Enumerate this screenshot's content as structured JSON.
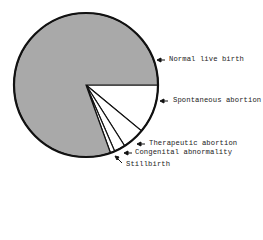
{
  "chart_data": {
    "type": "pie",
    "title": "",
    "unit": "percent (estimated)",
    "start_angle_deg": 0,
    "direction": "clockwise",
    "slices": [
      {
        "label": "Normal live birth",
        "value": 80.5,
        "fill": "#a9a9a9"
      },
      {
        "label": "Spontaneous abortion",
        "value": 11.0,
        "fill": "#ffffff"
      },
      {
        "label": "Therapeutic abortion",
        "value": 5.0,
        "fill": "#ffffff"
      },
      {
        "label": "Congenital abnormality",
        "value": 2.5,
        "fill": "#ffffff"
      },
      {
        "label": "Stillbirth",
        "value": 1.0,
        "fill": "#ffffff"
      }
    ],
    "order_of_slices": "clockwise from 3 o'clock: Spontaneous abortion, Therapeutic abortion, Congenital abnormality, Stillbirth, Normal live birth",
    "legend": "none (arrow callouts)",
    "grid": false
  },
  "labels": {
    "normal": "Normal live birth",
    "spontaneous": "Spontaneous abortion",
    "therapeutic": "Therapeutic abortion",
    "congenital": "Congenital abnormality",
    "stillbirth": "Stillbirth"
  },
  "colors": {
    "normal_fill": "#a9a9a9",
    "other_fill": "#ffffff",
    "stroke": "#111111"
  }
}
